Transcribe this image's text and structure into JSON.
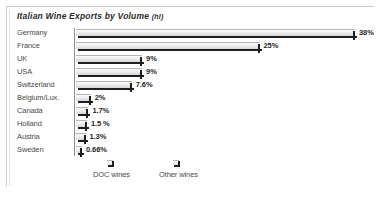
{
  "chart_data": {
    "type": "bar",
    "orientation": "horizontal",
    "title": "Italian Wine Exports by Volume",
    "title_unit": "(hl)",
    "xlabel": "",
    "ylabel": "",
    "grid": false,
    "xlim": [
      0,
      38
    ],
    "legend_position": "bottom",
    "categories": [
      "Germany",
      "France",
      "UK",
      "USA",
      "Switzerland",
      "Belgium/Lux.",
      "Canada",
      "Holland",
      "Austria",
      "Sweden"
    ],
    "values": [
      38,
      25,
      9,
      9,
      7.6,
      2,
      1.7,
      1.5,
      1.3,
      0.66
    ],
    "value_labels": [
      "38%",
      "25%",
      "9%",
      "9%",
      "7.6%",
      "2%",
      "1.7%",
      "1.5 %",
      "1.3%",
      "0.66%"
    ],
    "legend": [
      {
        "label": "DOC wines"
      },
      {
        "label": "Other wines"
      }
    ],
    "colors": {
      "bar_fill_light": "#fbfbfb",
      "bar_fill_dark": "#d6d6d6",
      "bar_edge": "#1e1e1e",
      "axis": "#8e8e8e",
      "label_text": "#4a4a4a",
      "value_text": "#1f1f1f",
      "frame": "#c9c9c9"
    }
  }
}
